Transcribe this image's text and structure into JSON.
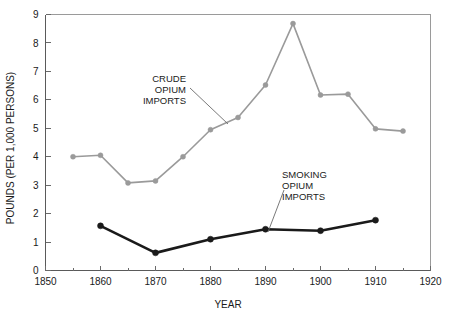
{
  "chart_data": {
    "type": "line",
    "title": "",
    "xlabel": "YEAR",
    "ylabel": "POUNDS (PER 1,000 PERSONS)",
    "xlim": [
      1850,
      1920
    ],
    "ylim": [
      0,
      9
    ],
    "grid": false,
    "legend_position": "inline-annotations",
    "x_tick_labels": [
      "1850",
      "1860",
      "1870",
      "1880",
      "1890",
      "1900",
      "1910",
      "1920"
    ],
    "x_tick_values": [
      1850,
      1860,
      1870,
      1880,
      1890,
      1900,
      1910,
      1920
    ],
    "x_minor_tick_values": [
      1855,
      1865,
      1875,
      1885,
      1895,
      1905,
      1915
    ],
    "y_tick_labels": [
      "0",
      "1",
      "2",
      "3",
      "4",
      "5",
      "6",
      "7",
      "8",
      "9"
    ],
    "y_tick_values": [
      0,
      1,
      2,
      3,
      4,
      5,
      6,
      7,
      8,
      9
    ],
    "series": [
      {
        "name": "CRUDE OPIUM IMPORTS",
        "color": "#9a9a9a",
        "marker": "circle",
        "x": [
          1855,
          1860,
          1865,
          1870,
          1875,
          1880,
          1885,
          1890,
          1895,
          1900,
          1905,
          1910,
          1915
        ],
        "values": [
          4.0,
          4.05,
          3.08,
          3.15,
          4.0,
          4.95,
          5.38,
          6.52,
          8.68,
          6.17,
          6.2,
          4.98,
          4.9
        ]
      },
      {
        "name": "SMOKING OPIUM IMPORTS",
        "color": "#1a1a1a",
        "marker": "circle",
        "x": [
          1860,
          1870,
          1880,
          1890,
          1900,
          1910
        ],
        "values": [
          1.57,
          0.62,
          1.1,
          1.45,
          1.4,
          1.77
        ]
      }
    ],
    "annotations": [
      {
        "id": "crude-label",
        "lines": [
          "CRUDE",
          "OPIUM",
          "IMPORTS"
        ],
        "align": "end",
        "text_x": 186,
        "text_y": 82,
        "leader": {
          "x1": 190,
          "y1": 88,
          "x2": 228,
          "y2": 124
        }
      },
      {
        "id": "smoking-label",
        "lines": [
          "SMOKING",
          "OPIUM",
          "IMPORTS"
        ],
        "align": "start",
        "text_x": 282,
        "text_y": 178,
        "leader": {
          "x1": 284,
          "y1": 190,
          "x2": 268,
          "y2": 232
        }
      }
    ]
  },
  "axes": {
    "x_title": "YEAR",
    "y_title": "POUNDS (PER 1,000 PERSONS)"
  }
}
